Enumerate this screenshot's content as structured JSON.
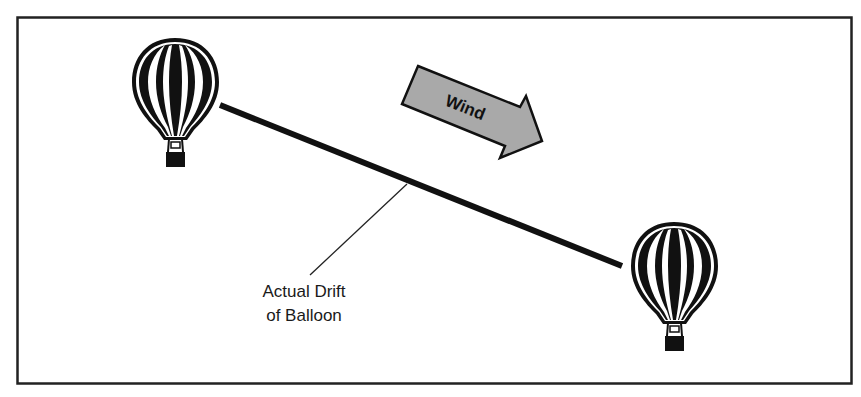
{
  "diagram": {
    "frame": {
      "border_color": "#222222"
    },
    "wind_arrow": {
      "label": "Wind",
      "fill_color": "#a9a9a9",
      "stroke_color": "#111111",
      "icon": "right-arrow-icon"
    },
    "drift_line": {
      "color": "#111111"
    },
    "callout": {
      "line1": "Actual Drift",
      "line2": "of Balloon"
    },
    "balloons": [
      {
        "name": "start-balloon",
        "icon": "hot-air-balloon-icon"
      },
      {
        "name": "end-balloon",
        "icon": "hot-air-balloon-icon"
      }
    ]
  }
}
